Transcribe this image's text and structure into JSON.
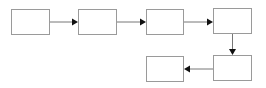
{
  "diagram": {
    "type": "flowchart",
    "colors": {
      "box_border": "#9a9a9a",
      "edge_line": "#777777",
      "arrowhead": "#111111",
      "background": "#ffffff"
    },
    "nodes": [
      {
        "id": "box-1",
        "label": "",
        "x": 11,
        "y": 9,
        "w": 39,
        "h": 26
      },
      {
        "id": "box-2",
        "label": "",
        "x": 78,
        "y": 9,
        "w": 39,
        "h": 26
      },
      {
        "id": "box-3",
        "label": "",
        "x": 146,
        "y": 9,
        "w": 38,
        "h": 26
      },
      {
        "id": "box-4",
        "label": "",
        "x": 213,
        "y": 8,
        "w": 39,
        "h": 26
      },
      {
        "id": "box-5",
        "label": "",
        "x": 213,
        "y": 55,
        "w": 39,
        "h": 26
      },
      {
        "id": "box-6",
        "label": "",
        "x": 146,
        "y": 56,
        "w": 38,
        "h": 26
      }
    ],
    "edges": [
      {
        "from": "box-1",
        "to": "box-2",
        "direction": "right"
      },
      {
        "from": "box-2",
        "to": "box-3",
        "direction": "right"
      },
      {
        "from": "box-3",
        "to": "box-4",
        "direction": "right"
      },
      {
        "from": "box-4",
        "to": "box-5",
        "direction": "down"
      },
      {
        "from": "box-5",
        "to": "box-6",
        "direction": "left"
      }
    ]
  }
}
